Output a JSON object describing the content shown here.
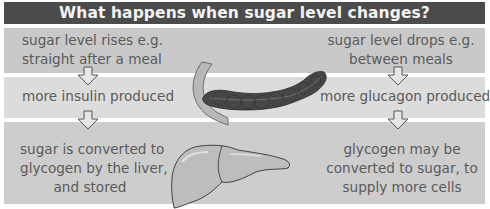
{
  "title": "What happens when sugar level changes?",
  "left": {
    "step1": [
      "sugar level rises e.g.",
      "straight after a meal"
    ],
    "step2": "more insulin produced",
    "step3": [
      "sugar is converted to",
      "glycogen by the liver,",
      "and stored"
    ]
  },
  "right": {
    "step1": [
      "sugar level drops e.g.",
      "between meals"
    ],
    "step2": "more glucagon produced",
    "step3": [
      "glycogen may be",
      "converted to sugar, to",
      "supply more cells"
    ]
  },
  "illustrations": {
    "pancreas": "pancreas-illustration",
    "liver": "liver-illustration",
    "duodenum": "duodenum-illustration"
  },
  "colors": {
    "title_bg": "#4b4b4b",
    "title_text": "#f4f4f4",
    "band_1": "#c9c9c9",
    "band_2": "#dcdcdc",
    "band_3": "#cdcdcd",
    "text": "#5a5a5a",
    "pancreas": "#474747",
    "liver": "#bdbdbd"
  }
}
